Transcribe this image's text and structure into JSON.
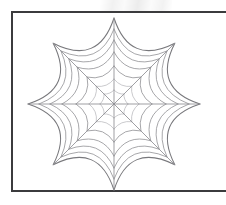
{
  "document": {
    "title": "Spider Web Line Drawing",
    "background_color": "#ffffff",
    "width": 226,
    "height": 205
  },
  "artboard": {
    "name": "drawing-frame",
    "border_color": "#3b3b3d",
    "border_width": 2,
    "fill_color": "#ffffff",
    "x": 11,
    "y": 11,
    "width": 224,
    "height": 181,
    "note": "frame is cropped by the right edge of the image"
  },
  "watermark": {
    "label": "faint-scan-smudge",
    "color": "rgba(0,0,0,0.06)"
  },
  "artwork": {
    "name": "spider-web",
    "type": "radial-web",
    "center": {
      "x": 114,
      "y": 104
    },
    "outer_radius": 86,
    "spoke_count": 8,
    "spoke_angles_deg": [
      90,
      45,
      0,
      315,
      270,
      225,
      180,
      135
    ],
    "ring_count": 7,
    "ring_radii": [
      14,
      25,
      38,
      52,
      64,
      75,
      86
    ],
    "sag_factor": 0.3,
    "stroke": {
      "spoke_color": "#8e8e92",
      "spoke_width": 0.85,
      "ring_color": "#97979b",
      "ring_width": 0.85,
      "outer_ring_color": "#78787c",
      "outer_ring_width": 1.05,
      "inner_ring_color": "#b3b3b8",
      "inner_ring_width": 0.7
    }
  },
  "chart_data": {
    "type": "line",
    "xlabel": "",
    "ylabel": "",
    "center": [
      114,
      104
    ],
    "spoke_angles_deg": [
      0,
      45,
      90,
      135,
      180,
      225,
      270,
      315
    ],
    "ring_radii": [
      14,
      25,
      38,
      52,
      64,
      75,
      86
    ],
    "xlim": [
      28,
      200
    ],
    "ylim": [
      18,
      190
    ],
    "grid": false,
    "legend": "none"
  }
}
